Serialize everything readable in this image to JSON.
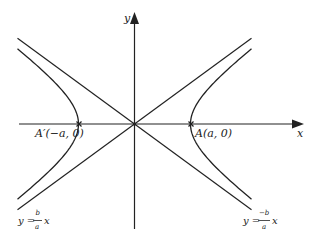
{
  "figure": {
    "colors": {
      "ink": "#222222",
      "background": "#ffffff"
    },
    "axes": {
      "x_label": "x",
      "y_label": "y"
    },
    "vertices": {
      "left": {
        "label": "A′(−a, 0)"
      },
      "right": {
        "label": "A(a, 0)"
      }
    },
    "asymptotes": {
      "positive": {
        "lhs": "y =",
        "numerator": "b",
        "denominator": "a",
        "var": "x"
      },
      "negative": {
        "lhs": "y =",
        "numerator": "−b",
        "denominator": "a",
        "var": "x"
      }
    },
    "geometry": {
      "origin": [
        134,
        124
      ],
      "a_px": 56,
      "b_px": 41,
      "x_axis": [
        19,
        304
      ],
      "y_axis": [
        12,
        229
      ]
    }
  }
}
